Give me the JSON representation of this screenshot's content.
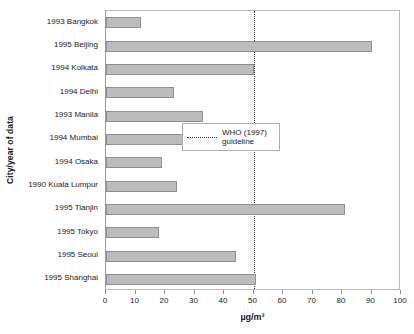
{
  "chart_data": {
    "type": "bar",
    "orientation": "horizontal",
    "title": "",
    "xlabel": "µg/m³",
    "ylabel": "City/year of data",
    "xlim": [
      0,
      100
    ],
    "xticks": [
      0,
      10,
      20,
      30,
      40,
      50,
      60,
      70,
      80,
      90,
      100
    ],
    "grid": false,
    "categories": [
      "1993 Bangkok",
      "1995 Beijing",
      "1994 Kolkata",
      "1994 Delhi",
      "1993 Manila",
      "1994 Mumbai",
      "1994 Osaka",
      "1990 Kuala Lumpur",
      "1995 Tianjin",
      "1995 Tokyo",
      "1995 Seoul",
      "1995 Shanghai"
    ],
    "values": [
      12,
      90,
      50,
      23,
      33,
      34,
      19,
      24,
      81,
      18,
      44,
      51
    ],
    "bar_color": "#bcbcbc",
    "bar_edge_color": "#8e8e8e",
    "annotations": [
      {
        "name": "who-guideline",
        "value": 50,
        "style": "dotted",
        "color": "#2b2b2b"
      }
    ],
    "legend": {
      "position": "center-right",
      "entries": [
        {
          "label": "WHO (1997)\nguideline",
          "marker": "dotted-line",
          "color": "#2b2b2b"
        }
      ]
    }
  }
}
